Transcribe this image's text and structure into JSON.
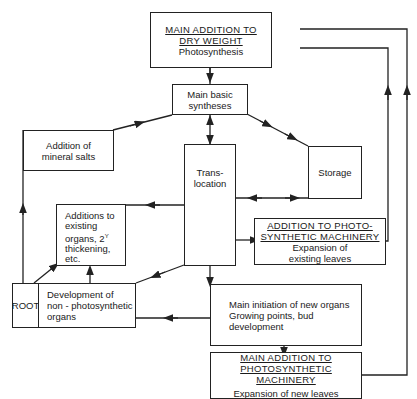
{
  "diagram": {
    "nodes": {
      "dry_weight": {
        "title_line1": "MAIN ADDITION TO",
        "title_line2": "DRY WEIGHT",
        "subtitle": "Photosynthesis"
      },
      "basic_syntheses": {
        "line1": "Main basic",
        "line2": "syntheses"
      },
      "mineral_salts": {
        "line1": "Addition of",
        "line2": "mineral salts"
      },
      "translocation": {
        "line1": "Trans-",
        "line2": "location"
      },
      "storage": {
        "label": "Storage"
      },
      "existing_organs": {
        "line1": "Additions to",
        "line2": "existing",
        "line3": "organs, 2",
        "sup": "Y",
        "line4": "thickening,",
        "line5": "etc."
      },
      "photo_existing": {
        "title_line1": "ADDITION TO PHOTO-",
        "title_line2": "SYNTHETIC MACHINERY",
        "sub_line1": "Expansion of",
        "sub_line2": "existing leaves"
      },
      "root": {
        "label": "ROOT"
      },
      "non_photo": {
        "line1": "Development of",
        "line2": "non - photosynthetic",
        "line3": "organs"
      },
      "initiation": {
        "line1": "Main initiation of new organs",
        "line2": "Growing points, bud",
        "line3": "development"
      },
      "photo_new": {
        "title_line1": "MAIN ADDITION TO",
        "title_line2": "PHOTOSYNTHETIC MACHINERY",
        "subtitle": "Expansion of new leaves"
      }
    },
    "edges": [
      {
        "from": "dry_weight",
        "to": "basic_syntheses"
      },
      {
        "from": "basic_syntheses",
        "to": "translocation",
        "bidirectional": true
      },
      {
        "from": "basic_syntheses",
        "to": "storage",
        "bidirectional": true
      },
      {
        "from": "mineral_salts",
        "to": "basic_syntheses"
      },
      {
        "from": "root",
        "to": "mineral_salts"
      },
      {
        "from": "storage",
        "to": "translocation",
        "bidirectional": true
      },
      {
        "from": "translocation",
        "to": "existing_organs"
      },
      {
        "from": "translocation",
        "to": "photo_existing"
      },
      {
        "from": "translocation",
        "to": "non_photo"
      },
      {
        "from": "translocation",
        "to": "initiation"
      },
      {
        "from": "initiation",
        "to": "non_photo"
      },
      {
        "from": "initiation",
        "to": "photo_new"
      },
      {
        "from": "non_photo",
        "to": "existing_organs"
      },
      {
        "from": "root",
        "to": "existing_organs"
      },
      {
        "from": "photo_existing",
        "to": "dry_weight"
      },
      {
        "from": "photo_new",
        "to": "dry_weight"
      }
    ]
  }
}
